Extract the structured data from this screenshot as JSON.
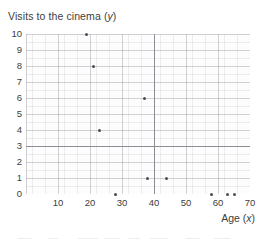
{
  "chart_data": {
    "type": "scatter",
    "title_plain": "Visits to the cinema",
    "title_variable": "y",
    "xlabel": "Age (x)",
    "xlabel_plain": "Age",
    "xlabel_variable": "x",
    "ylabel": "Visits to the cinema",
    "xlim": [
      0,
      70
    ],
    "ylim": [
      0,
      10
    ],
    "xticks": [
      10,
      20,
      30,
      40,
      50,
      60,
      70
    ],
    "yticks": [
      0,
      1,
      2,
      3,
      4,
      5,
      6,
      7,
      8,
      9,
      10
    ],
    "grid": true,
    "legend": null,
    "point_color": "#4a4a52",
    "reference_lines": [
      {
        "name": "horizontal-mean-line",
        "orientation": "horizontal",
        "value": 3,
        "color": "#8d8d95"
      },
      {
        "name": "vertical-mean-line",
        "orientation": "vertical",
        "value": 40,
        "color": "#8d8d95"
      }
    ],
    "points": [
      {
        "x": 19,
        "y": 10
      },
      {
        "x": 21,
        "y": 8
      },
      {
        "x": 23,
        "y": 4
      },
      {
        "x": 37,
        "y": 6
      },
      {
        "x": 38,
        "y": 1
      },
      {
        "x": 44,
        "y": 1
      },
      {
        "x": 28,
        "y": 0
      },
      {
        "x": 58,
        "y": 0
      },
      {
        "x": 63,
        "y": 0
      },
      {
        "x": 65,
        "y": 0
      }
    ]
  }
}
